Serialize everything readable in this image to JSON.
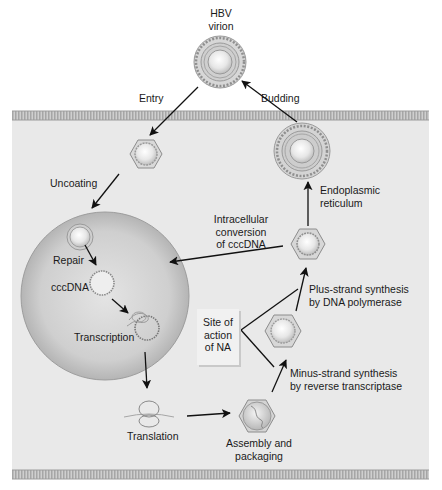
{
  "colors": {
    "cell_bg": "#e9e9e9",
    "membrane": "#b9b9b9",
    "nucleus_edge": "#a8a8a8",
    "nucleus_center": "#dcdcdc",
    "arrow": "#111111",
    "na_box": "#f1f1f1"
  },
  "labels": {
    "virion_line1": "HBV",
    "virion_line2": "virion",
    "entry": "Entry",
    "budding": "Budding",
    "uncoating": "Uncoating",
    "er_line1": "Endoplasmic",
    "er_line2": "reticulum",
    "repair": "Repair",
    "cccdna": "cccDNA",
    "transcription": "Transcription",
    "intracellular_line1": "Intracellular",
    "intracellular_line2": "conversion",
    "intracellular_line3": "of cccDNA",
    "plus_line1": "Plus-strand synthesis",
    "plus_line2": "by DNA polymerase",
    "site_line1": "Site of",
    "site_line2": "action",
    "site_line3": "of NA",
    "minus_line1": "Minus-strand synthesis",
    "minus_line2": "by reverse transcriptase",
    "translation": "Translation",
    "assembly_line1": "Assembly and",
    "assembly_line2": "packaging"
  },
  "stages": [
    {
      "id": "virion",
      "x": 220,
      "y": 62
    },
    {
      "id": "entry-capsid",
      "x": 146,
      "y": 154
    },
    {
      "id": "uncoated-capsid",
      "x": 80,
      "y": 237
    },
    {
      "id": "cccdna",
      "x": 102,
      "y": 283
    },
    {
      "id": "transcription",
      "x": 141,
      "y": 322
    },
    {
      "id": "translation",
      "x": 149,
      "y": 415
    },
    {
      "id": "assembly",
      "x": 257,
      "y": 416
    },
    {
      "id": "minus-strand-capsid",
      "x": 283,
      "y": 331
    },
    {
      "id": "plus-strand-capsid",
      "x": 308,
      "y": 244
    },
    {
      "id": "er-virion",
      "x": 302,
      "y": 151
    }
  ]
}
